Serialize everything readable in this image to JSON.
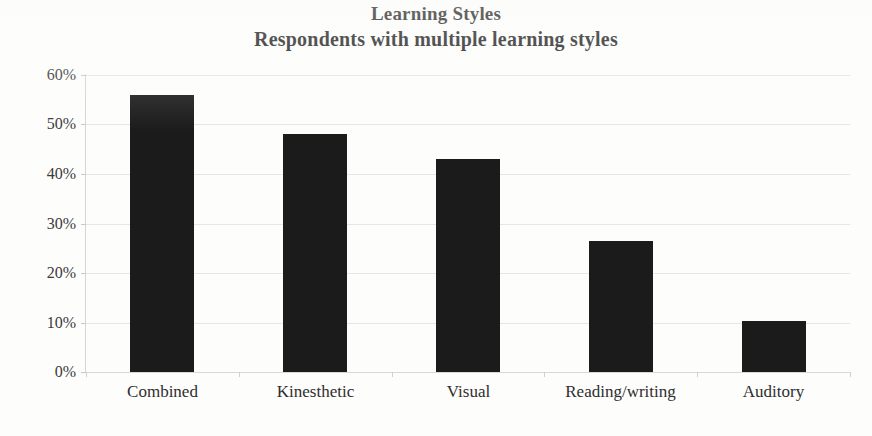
{
  "chart_data": {
    "type": "bar",
    "title": "Learning Styles",
    "subtitle": "Respondents with multiple learning styles",
    "categories": [
      "Combined",
      "Kinesthetic",
      "Visual",
      "Reading/writing",
      "Auditory"
    ],
    "values": [
      56,
      48,
      43,
      26.5,
      10.4
    ],
    "value_labels": [
      "56%",
      "48%",
      "43%",
      "26.5%",
      "10.4%"
    ],
    "xlabel": "",
    "ylabel": "",
    "ylim": [
      0,
      60
    ],
    "ytick_values": [
      60,
      50,
      40,
      30,
      20,
      10,
      0
    ],
    "ytick_labels": [
      "60%",
      "50%",
      "40%",
      "30%",
      "20%",
      "10%",
      "0%"
    ],
    "grid": true,
    "legend": false,
    "legend_position": "none",
    "series": [
      {
        "name": "Respondents",
        "values": [
          56,
          48,
          43,
          26.5,
          10.4
        ]
      }
    ],
    "colors": {
      "bar": "#1b1b1b",
      "gridline": "#e6e6e4",
      "axis": "#d5d5d3",
      "text": "#2b2b2b",
      "background": "#fdfdfc"
    }
  }
}
